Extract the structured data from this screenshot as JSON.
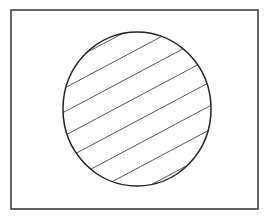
{
  "diagram": {
    "type": "venn",
    "universe": {
      "x": 11,
      "y": 10,
      "width": 247,
      "height": 199,
      "stroke": "#333333"
    },
    "set": {
      "cx": 137,
      "cy": 109,
      "rx": 74,
      "ry": 77,
      "stroke": "#222222",
      "fill": "hatched",
      "hatch": {
        "stroke": "#555555",
        "angle_deg": -28,
        "count": 8,
        "spacing": 21
      }
    },
    "labels": []
  }
}
